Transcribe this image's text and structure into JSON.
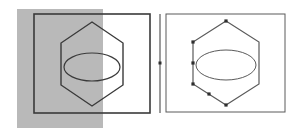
{
  "canvas": {
    "width": 300,
    "height": 139,
    "background_color": "#ffffff",
    "line_color": "#3a3a3a",
    "thin_line_color": "#5a5a5a",
    "selection_fill_color": "#b9b9b9",
    "vertex_marker_color": "#2e2e2e"
  },
  "panels": [
    {
      "id": "left-panel",
      "name": "left-view-panel",
      "frame": {
        "x": 34,
        "y": 14,
        "width": 116,
        "height": 99
      },
      "frame_stroke_width": 1.6,
      "selection_overlay": {
        "name": "selection-highlight-rect",
        "x": 17,
        "y": 9,
        "width": 86,
        "height": 119,
        "fill": "#b9b9b9",
        "opacity": 1
      },
      "hexagon": {
        "name": "hexagon-outline",
        "center_x": 92,
        "center_y": 64,
        "radius_x": 31,
        "radius_y": 42,
        "orientation": "pointy-top",
        "points": "92,22 123,43 123,85 92,106 61,85 61,43",
        "stroke_width": 1.4
      },
      "ellipse": {
        "name": "ellipse-outline",
        "cx": 92,
        "cy": 67,
        "rx": 28,
        "ry": 14,
        "stroke_width": 1.2
      },
      "vertex_markers": []
    },
    {
      "id": "right-panel",
      "name": "right-view-panel",
      "frame": {
        "x": 166,
        "y": 14,
        "width": 119,
        "height": 98
      },
      "frame_stroke_width": 1.0,
      "selection_overlay": null,
      "hexagon": {
        "name": "hexagon-outline",
        "center_x": 226,
        "center_y": 63,
        "radius_x": 33,
        "radius_y": 43,
        "orientation": "pointy-top",
        "points": "226,21 259,42 259,84 226,105 193,84 193,42",
        "stroke_width": 1.2
      },
      "ellipse": {
        "name": "ellipse-outline",
        "cx": 226,
        "cy": 65,
        "rx": 30,
        "ry": 15,
        "stroke_width": 1.0
      },
      "vertex_markers": [
        {
          "name": "vertex-marker-top",
          "cx": 226,
          "cy": 21
        },
        {
          "name": "vertex-marker-left-upper",
          "cx": 193,
          "cy": 42
        },
        {
          "name": "vertex-marker-left-mid",
          "cx": 193,
          "cy": 63
        },
        {
          "name": "vertex-marker-left-lower",
          "cx": 193,
          "cy": 84
        },
        {
          "name": "vertex-marker-bottom-left-edge",
          "cx": 209,
          "cy": 94
        },
        {
          "name": "vertex-marker-bottom",
          "cx": 226,
          "cy": 105
        }
      ]
    }
  ],
  "divider": {
    "name": "vertical-reference-line",
    "x": 160,
    "y1": 14,
    "y2": 113,
    "stroke_width": 1.2,
    "midpoint_marker": {
      "name": "midpoint-tick-marker",
      "cx": 160,
      "cy": 63
    }
  }
}
